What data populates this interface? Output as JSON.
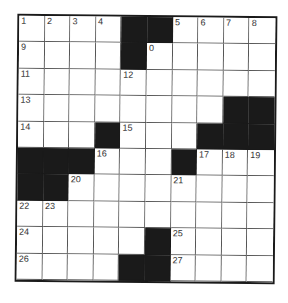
{
  "puzzle": {
    "rows": 10,
    "cols": 10,
    "grid": [
      [
        "1",
        "2",
        "3",
        "4",
        "#",
        "#",
        "5",
        "6",
        "7",
        "8"
      ],
      [
        "9",
        "",
        "",
        "",
        "#",
        "0",
        "",
        "",
        "",
        ""
      ],
      [
        "11",
        "",
        "",
        "",
        "12",
        "",
        "",
        "",
        "",
        ""
      ],
      [
        "13",
        "",
        "",
        "",
        "",
        "",
        "",
        "",
        "#",
        "#"
      ],
      [
        "14",
        "",
        "",
        "#",
        "15",
        "",
        "",
        "#",
        "#",
        "#"
      ],
      [
        "#",
        "#",
        "#",
        "16",
        "",
        "",
        "#",
        "17",
        "18",
        "19"
      ],
      [
        "#",
        "#",
        "20",
        "",
        "",
        "",
        "21",
        "",
        "",
        ""
      ],
      [
        "22",
        "23",
        "",
        "",
        "",
        "",
        "",
        "",
        "",
        ""
      ],
      [
        "24",
        "",
        "",
        "",
        "",
        "#",
        "25",
        "",
        "",
        ""
      ],
      [
        "26",
        "",
        "",
        "",
        "#",
        "#",
        "27",
        "",
        "",
        ""
      ]
    ]
  },
  "colors": {
    "block": "#1a1a1a",
    "line": "#555555",
    "background": "#ffffff"
  }
}
